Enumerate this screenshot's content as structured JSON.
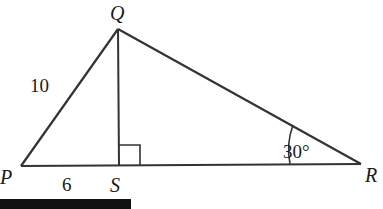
{
  "diagram": {
    "type": "triangle",
    "vertices": {
      "P": {
        "label": "P",
        "x": 21,
        "y": 166
      },
      "Q": {
        "label": "Q",
        "x": 118,
        "y": 29
      },
      "R": {
        "label": "R",
        "x": 361,
        "y": 164
      },
      "S": {
        "label": "S",
        "x": 119,
        "y": 166
      }
    },
    "side_labels": {
      "PQ": "10",
      "PS": "6"
    },
    "angle_labels": {
      "R": "30°"
    },
    "right_angle_at": "S",
    "altitude": "QS",
    "colors": {
      "line": "#333333",
      "text": "#1a1a1a",
      "bar": "#111111"
    }
  }
}
